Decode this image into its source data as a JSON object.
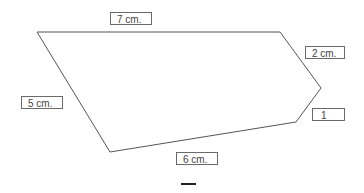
{
  "figure": {
    "vertices": [
      [
        37,
        32
      ],
      [
        280,
        32
      ],
      [
        321,
        88
      ],
      [
        296,
        122
      ],
      [
        110,
        152
      ]
    ],
    "stroke_color": "#555555"
  },
  "labels": {
    "top": "7 cm.",
    "upper_right": "2 cm.",
    "left": "5 cm.",
    "lower_right": "1",
    "bottom": "6 cm."
  },
  "footer_mark": "—"
}
